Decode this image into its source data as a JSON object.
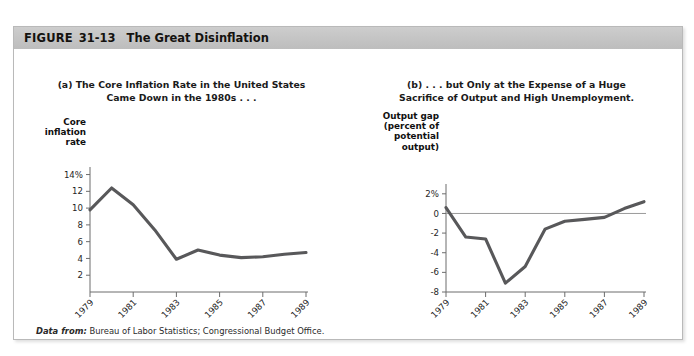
{
  "figure": {
    "label": "FIGURE",
    "number": "31-13",
    "title": "The Great Disinflation",
    "source_lead": "Data from:",
    "source_text": "Bureau of Labor Statistics; Congressional Budget Office.",
    "header_color": "#c4c4c4",
    "line_color": "#58585a",
    "axis_color": "#6d6d6d"
  },
  "chart_data": [
    {
      "type": "line",
      "panel": "a",
      "title": "(a) The Core Inflation Rate in the United States\nCame Down in the 1980s . . .",
      "ylabel": "Core\ninflation\nrate",
      "xlabel": "Year",
      "x": [
        1979,
        1980,
        1981,
        1982,
        1983,
        1984,
        1985,
        1986,
        1987,
        1988,
        1989
      ],
      "values": [
        9.8,
        12.4,
        10.4,
        7.4,
        3.9,
        5.0,
        4.4,
        4.1,
        4.2,
        4.5,
        4.7
      ],
      "ytick_values": [
        14,
        12,
        10,
        8,
        6,
        4,
        2
      ],
      "ytick_labels": [
        "14%",
        "12",
        "10",
        "8",
        "6",
        "4",
        "2"
      ],
      "xtick_values": [
        1979,
        1981,
        1983,
        1985,
        1987,
        1989
      ],
      "xtick_labels": [
        "1979",
        "1981",
        "1983",
        "1985",
        "1987",
        "1989"
      ],
      "ylim": [
        0,
        14.9
      ],
      "xlim": [
        1979,
        1989
      ],
      "grid": false,
      "zero_line": false,
      "legend": "none"
    },
    {
      "type": "line",
      "panel": "b",
      "title": "(b) . . . but Only at the Expense of a Huge\nSacrifice of Output and High Unemployment.",
      "ylabel": "Output gap\n(percent of\npotential\noutput)",
      "xlabel": "Year",
      "x": [
        1979,
        1980,
        1981,
        1982,
        1983,
        1984,
        1985,
        1986,
        1987,
        1988,
        1989
      ],
      "values": [
        0.6,
        -2.4,
        -2.6,
        -7.1,
        -5.4,
        -1.6,
        -0.8,
        -0.6,
        -0.4,
        0.5,
        1.2
      ],
      "ytick_values": [
        2,
        0,
        -2,
        -4,
        -6,
        -8
      ],
      "ytick_labels": [
        "2%",
        "0",
        "-2",
        "-4",
        "-6",
        "-8"
      ],
      "xtick_values": [
        1979,
        1981,
        1983,
        1985,
        1987,
        1989
      ],
      "xtick_labels": [
        "1979",
        "1981",
        "1983",
        "1985",
        "1987",
        "1989"
      ],
      "ylim": [
        -8,
        3
      ],
      "xlim": [
        1979,
        1989
      ],
      "grid": false,
      "zero_line": true,
      "legend": "none"
    }
  ]
}
